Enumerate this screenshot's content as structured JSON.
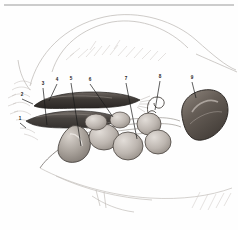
{
  "figure": {
    "medium": "pencil and grey wash drawing",
    "background_color": "#fefefe",
    "ink_color": "#1a1a1a",
    "top_rule_color": "#9a9a9a",
    "labels": [
      {
        "n": "1",
        "x": 20,
        "y": 121,
        "lx": 26,
        "ly": 128
      },
      {
        "n": "2",
        "x": 22,
        "y": 97,
        "lx": 33,
        "ly": 104
      },
      {
        "n": "3",
        "x": 43,
        "y": 86,
        "lx": 47,
        "ly": 125
      },
      {
        "n": "4",
        "x": 57,
        "y": 82,
        "lx": 49,
        "ly": 101
      },
      {
        "n": "5",
        "x": 71,
        "y": 81,
        "lx": 81,
        "ly": 146
      },
      {
        "n": "6",
        "x": 90,
        "y": 82,
        "lx": 113,
        "ly": 117
      },
      {
        "n": "7",
        "x": 126,
        "y": 81,
        "lx": 137,
        "ly": 139
      },
      {
        "n": "8",
        "x": 160,
        "y": 79,
        "lx": 155,
        "ly": 110
      },
      {
        "n": "9",
        "x": 192,
        "y": 80,
        "lx": 196,
        "ly": 98
      }
    ],
    "organs": [
      {
        "name": "duodenum-dark-band",
        "tone": "#4a4440"
      },
      {
        "name": "pancreas-lower-band",
        "tone": "#57514c"
      },
      {
        "name": "gallbladder",
        "tone": "#9a938c"
      },
      {
        "name": "intestinal-loops",
        "tone": "#b3aca6"
      },
      {
        "name": "coiled-tube",
        "tone": "#a8a19b"
      },
      {
        "name": "spleen",
        "tone": "#6b635c"
      }
    ]
  }
}
